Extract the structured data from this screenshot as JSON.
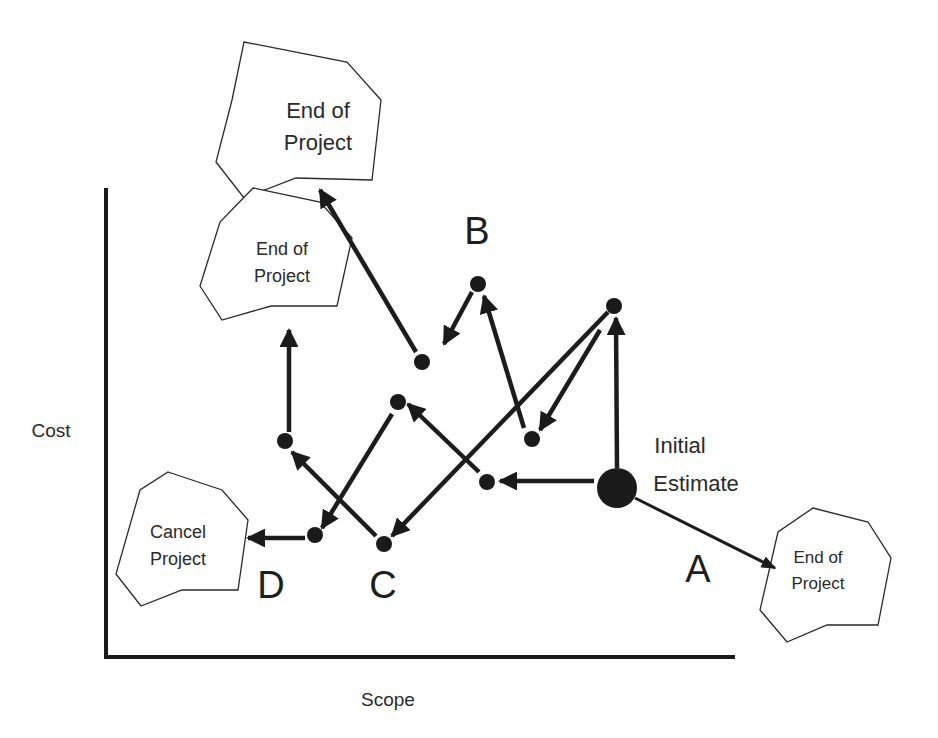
{
  "diagram": {
    "axes": {
      "y_label": "Cost",
      "x_label": "Scope"
    },
    "outcomes": [
      {
        "id": "end-top",
        "line1": "End of",
        "line2": "Project",
        "font_size": 22,
        "polygon": "244,42 347,62 381,100 372,180 296,178 244,198 216,162 232,100",
        "text_x": 318,
        "text_y1": 118,
        "text_y2": 150
      },
      {
        "id": "end-mid",
        "line1": "End of",
        "line2": "Project",
        "font_size": 18,
        "polygon": "253,188 320,202 352,238 337,306 271,306 222,320 200,286 220,222",
        "text_x": 282,
        "text_y1": 255,
        "text_y2": 282
      },
      {
        "id": "end-a",
        "line1": "End of",
        "line2": "Project",
        "font_size": 17,
        "polygon": "813,508 868,522 891,558 878,625 827,625 787,642 760,610 778,532",
        "text_x": 818,
        "text_y1": 563,
        "text_y2": 589
      },
      {
        "id": "cancel",
        "line1": "Cancel",
        "line2": "Project",
        "font_size": 18,
        "polygon": "168,472 222,490 248,520 238,590 182,590 141,606 116,574 140,490",
        "text_x": 178,
        "text_y1": 538,
        "text_y2": 565
      }
    ],
    "path_letters": [
      {
        "label": "A",
        "x": 698,
        "y": 582
      },
      {
        "label": "B",
        "x": 477,
        "y": 244
      },
      {
        "label": "C",
        "x": 383,
        "y": 598
      },
      {
        "label": "D",
        "x": 271,
        "y": 598
      }
    ],
    "start_node": {
      "label_line1": "Initial",
      "label_line2": "Estimate",
      "x": 617,
      "y": 488,
      "r": 20
    },
    "nodes": [
      {
        "id": "n-topright",
        "x": 614,
        "y": 306,
        "r": 8
      },
      {
        "id": "n-btop",
        "x": 478,
        "y": 284,
        "r": 8
      },
      {
        "id": "n-b2",
        "x": 422,
        "y": 362,
        "r": 8
      },
      {
        "id": "n-400",
        "x": 398,
        "y": 402,
        "r": 8
      },
      {
        "id": "n-532",
        "x": 532,
        "y": 439,
        "r": 8
      },
      {
        "id": "n-487",
        "x": 487,
        "y": 482,
        "r": 8
      },
      {
        "id": "n-285",
        "x": 285,
        "y": 441,
        "r": 8
      },
      {
        "id": "n-d",
        "x": 315,
        "y": 535,
        "r": 8
      },
      {
        "id": "n-c",
        "x": 384,
        "y": 544,
        "r": 8
      }
    ],
    "arrows": [
      {
        "id": "a-start-up",
        "x1": 617,
        "y1": 468,
        "x2": 616,
        "y2": 318,
        "style": "thick"
      },
      {
        "id": "a-topright-532",
        "x1": 600,
        "y1": 330,
        "x2": 540,
        "y2": 430,
        "style": "thick"
      },
      {
        "id": "a-topright-c",
        "x1": 608,
        "y1": 312,
        "x2": 392,
        "y2": 536,
        "style": "thick"
      },
      {
        "id": "a-532-btop",
        "x1": 524,
        "y1": 428,
        "x2": 484,
        "y2": 296,
        "style": "thick"
      },
      {
        "id": "a-btop-b2",
        "x1": 472,
        "y1": 292,
        "x2": 444,
        "y2": 344,
        "style": "thick"
      },
      {
        "id": "a-b2-endtop",
        "x1": 416,
        "y1": 352,
        "x2": 320,
        "y2": 190,
        "style": "thick"
      },
      {
        "id": "a-start-487",
        "x1": 594,
        "y1": 481,
        "x2": 500,
        "y2": 481,
        "style": "thick"
      },
      {
        "id": "a-487-400",
        "x1": 479,
        "y1": 472,
        "x2": 408,
        "y2": 404,
        "style": "thick"
      },
      {
        "id": "a-400-d",
        "x1": 392,
        "y1": 414,
        "x2": 322,
        "y2": 528,
        "style": "thick"
      },
      {
        "id": "a-d-cancel",
        "x1": 305,
        "y1": 538,
        "x2": 248,
        "y2": 538,
        "style": "thick"
      },
      {
        "id": "a-c-285",
        "x1": 376,
        "y1": 536,
        "x2": 292,
        "y2": 452,
        "style": "thick"
      },
      {
        "id": "a-285-endmid",
        "x1": 289,
        "y1": 432,
        "x2": 289,
        "y2": 330,
        "style": "thick"
      },
      {
        "id": "a-start-enda",
        "x1": 635,
        "y1": 498,
        "x2": 775,
        "y2": 568,
        "style": "thin"
      }
    ],
    "colors": {
      "ink": "#1a1a1a",
      "background": "#ffffff"
    }
  }
}
